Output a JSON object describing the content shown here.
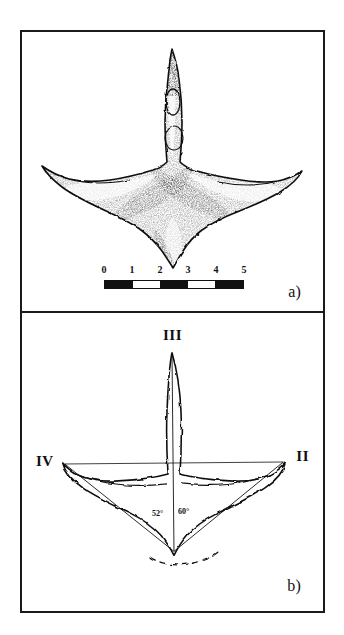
{
  "figure": {
    "type": "two-panel scientific plate"
  },
  "panel_a": {
    "label": "a)",
    "illustration_name": "stippled-ink-drawing-of-tridactyl-footprint",
    "scalebar": {
      "units_label": "",
      "ticks": [
        "0",
        "1",
        "2",
        "3",
        "4",
        "5"
      ],
      "segments": [
        "black",
        "white",
        "black",
        "white",
        "black"
      ],
      "segment_count": 5
    }
  },
  "panel_b": {
    "label": "b)",
    "illustration_name": "outline-interpretive-drawing-of-tridactyl-footprint",
    "digit_labels": [
      {
        "name": "digit-III",
        "text": "III",
        "position": "top-center"
      },
      {
        "name": "digit-IV",
        "text": "IV",
        "position": "left"
      },
      {
        "name": "digit-II",
        "text": "II",
        "position": "right"
      }
    ],
    "angles": [
      {
        "name": "angle-III-IV",
        "text": "52°"
      },
      {
        "name": "angle-II-III",
        "text": "60°"
      }
    ]
  },
  "colors": {
    "ink": "#111111",
    "background": "#ffffff",
    "border": "#1a1a1a"
  }
}
